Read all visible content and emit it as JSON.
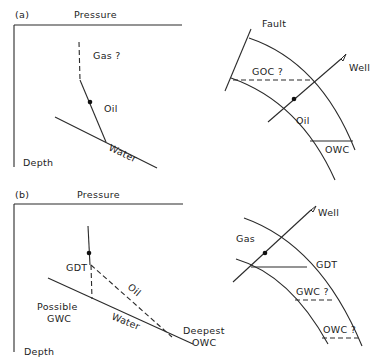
{
  "figure": {
    "panel_a": {
      "label": "(a)",
      "plot": {
        "x_axis_label": "Pressure",
        "y_axis_label": "Depth",
        "gas_label": "Gas ?",
        "oil_label": "Oil",
        "water_label": "Water"
      },
      "cross_section": {
        "fault_label": "Fault",
        "well_label": "Well",
        "goc_label": "GOC ?",
        "oil_label": "Oil",
        "owc_label": "OWC"
      }
    },
    "panel_b": {
      "label": "(b)",
      "plot": {
        "x_axis_label": "Pressure",
        "y_axis_label": "Depth",
        "gdt_label": "GDT",
        "oil_label": "Oil",
        "water_label": "Water",
        "possible_gwc_line1": "Possible",
        "possible_gwc_line2": "GWC",
        "deepest_owc_line1": "Deepest",
        "deepest_owc_line2": "OWC"
      },
      "cross_section": {
        "well_label": "Well",
        "gas_label": "Gas",
        "gdt_label": "GDT",
        "gwc_label": "GWC ?",
        "owc_label": "OWC ?"
      }
    }
  }
}
